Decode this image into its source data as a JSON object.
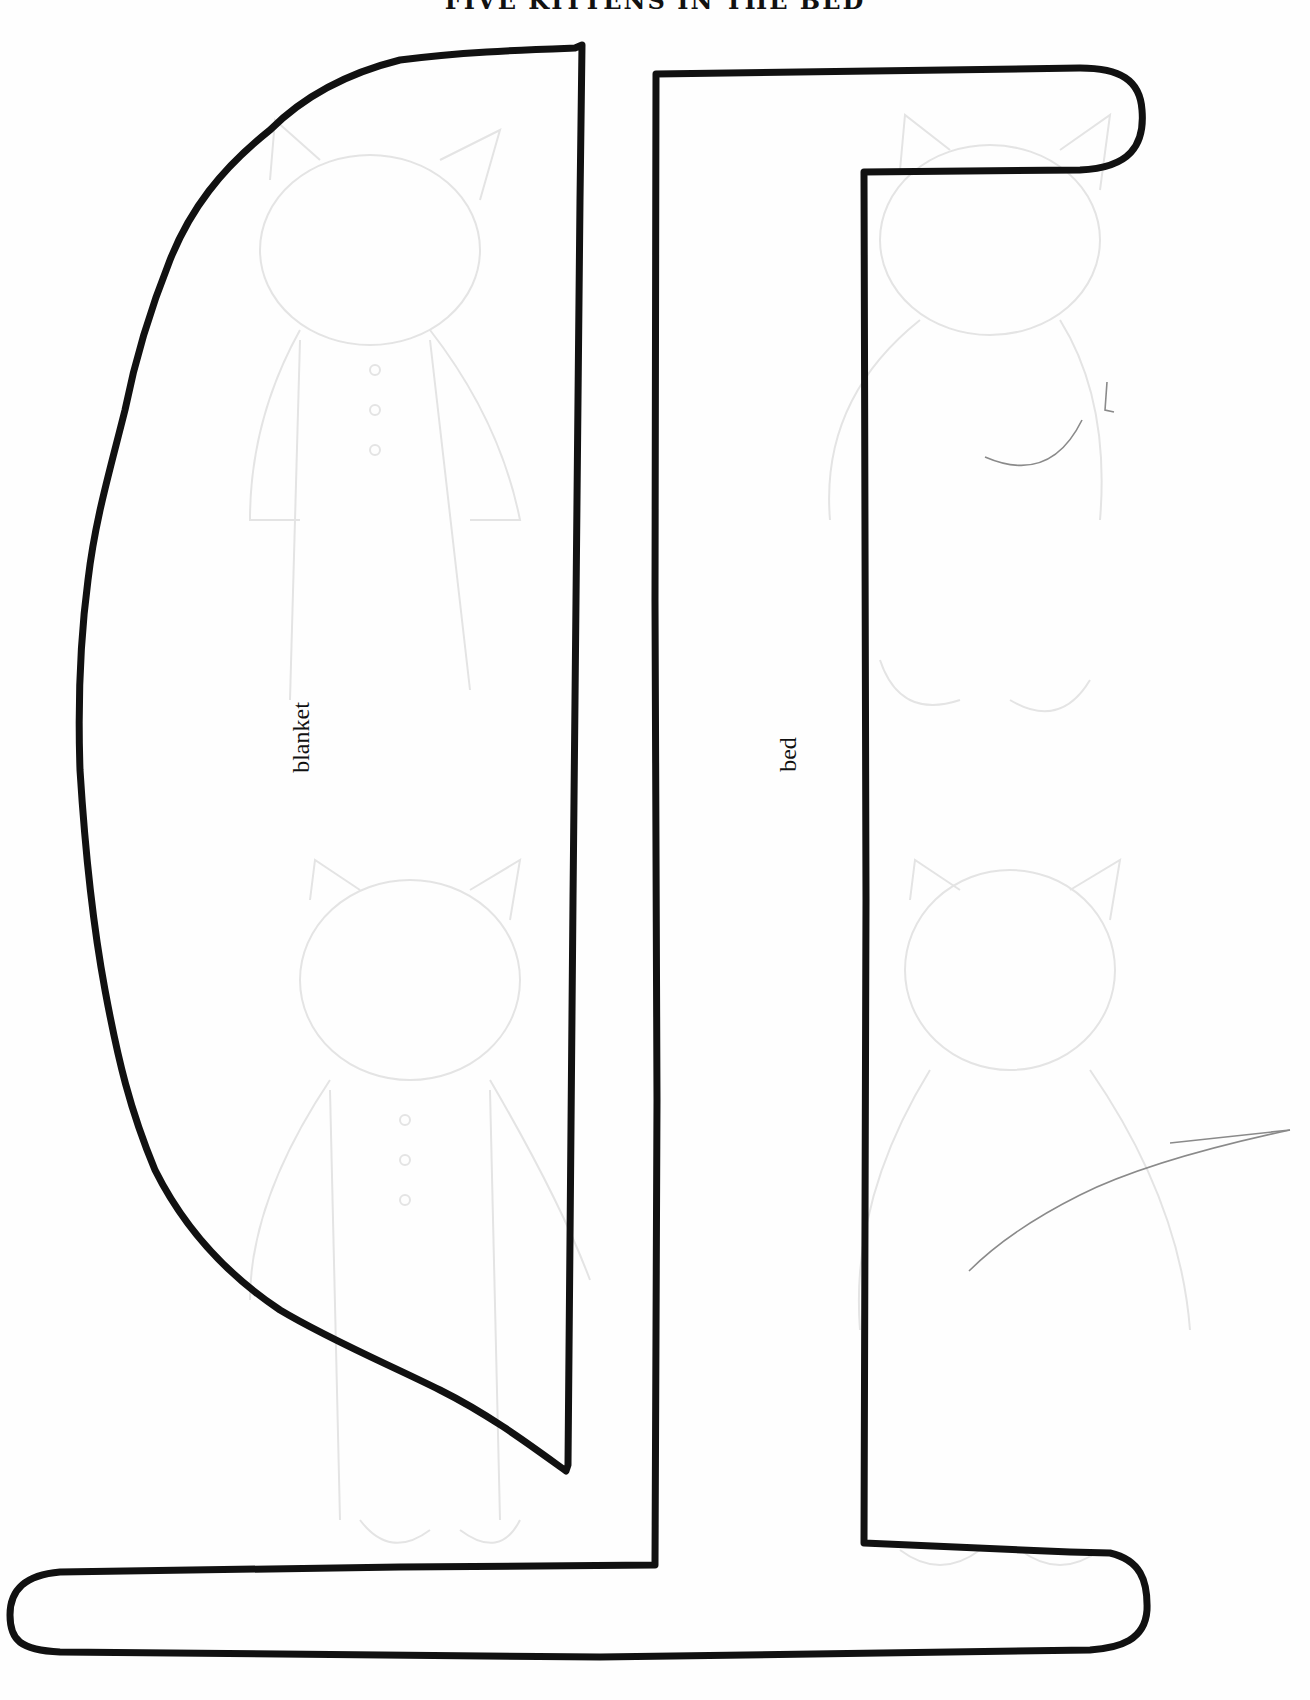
{
  "page": {
    "title": "FIVE KITTENS IN THE BED",
    "background_color": "#fefefe",
    "ink_color": "#111111",
    "pencil_color": "#8a8a8a"
  },
  "pattern_pieces": [
    {
      "id": "blanket",
      "label": "blanket",
      "shape": "half-oval cutout (flat right edge)"
    },
    {
      "id": "bed",
      "label": "bed",
      "shape": "bracket / side-view bed frame with headboard bar and long foot bar"
    }
  ],
  "background_sketches": {
    "description": "faint pencil outlines of kittens in pajamas behind the pieces",
    "count_visible": 4
  },
  "stray_marks": [
    {
      "type": "pencil-curve",
      "area": "upper right"
    },
    {
      "type": "pencil-line",
      "area": "lower right"
    }
  ]
}
